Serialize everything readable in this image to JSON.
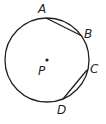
{
  "diagram": {
    "type": "circle-with-chords",
    "circle": {
      "center_label": "P",
      "cx": 47,
      "cy": 60,
      "r": 42
    },
    "points": [
      {
        "label": "A",
        "x": 46,
        "y": 18
      },
      {
        "label": "B",
        "x": 82,
        "y": 36
      },
      {
        "label": "C",
        "x": 87,
        "y": 70
      },
      {
        "label": "D",
        "x": 63,
        "y": 99
      }
    ],
    "chords": [
      [
        "A",
        "B"
      ],
      [
        "C",
        "D"
      ]
    ],
    "labels": {
      "A": "A",
      "B": "B",
      "C": "C",
      "D": "D",
      "P": "P"
    }
  }
}
